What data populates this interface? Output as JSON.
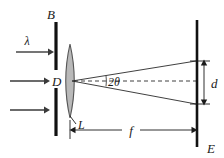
{
  "figure": {
    "type": "optical-ray-diagram",
    "background_color": "#ffffff",
    "ink_color": "#1a1a1a",
    "lens_fill_color": "#b9b9b9"
  },
  "labels": {
    "barrier": "B",
    "wavelength": "λ",
    "aperture": "D",
    "lens": "L",
    "angle": "2θ",
    "spot_size": "d",
    "focal_length": "f",
    "screen": "E"
  },
  "components": {
    "barrier": {
      "name": "B",
      "x": 56,
      "top_segment": {
        "y1": 22,
        "y2": 70
      },
      "bottom_segment": {
        "y1": 88,
        "y2": 136
      },
      "aperture_gap": {
        "y1": 70,
        "y2": 88
      }
    },
    "lens": {
      "name": "L",
      "center_x": 70,
      "center_y": 81,
      "half_width": 8,
      "half_height": 37
    },
    "screen": {
      "name": "E",
      "x": 197,
      "y1": 20,
      "y2": 147
    }
  },
  "incoming_beams": [
    {
      "label": "λ",
      "y": 52,
      "x_start": 16,
      "x_end": 52
    },
    {
      "label": "",
      "y": 81,
      "x_start": 10,
      "x_end": 50
    },
    {
      "label": "",
      "y": 110,
      "x_start": 10,
      "x_end": 50
    }
  ],
  "rays": {
    "origin_x": 72,
    "origin_y": 81,
    "upper_end": {
      "x": 196,
      "y": 61
    },
    "lower_end": {
      "x": 196,
      "y": 104
    },
    "axis": {
      "x1": 74,
      "y1": 81,
      "x2": 196,
      "y2": 81
    }
  },
  "dimensions": {
    "d": {
      "label": "d",
      "x": 204,
      "y_top": 61,
      "y_bottom": 104,
      "label_x": 211,
      "label_y": 86
    },
    "f": {
      "label": "f",
      "y": 130,
      "x_left": 70,
      "x_right": 197,
      "label_x": 130,
      "label_y": 129
    }
  },
  "angle_marker": {
    "label": "2θ",
    "vertex_x": 72,
    "vertex_y": 81,
    "arc_radius": 34,
    "label_x": 108,
    "label_y": 86
  }
}
